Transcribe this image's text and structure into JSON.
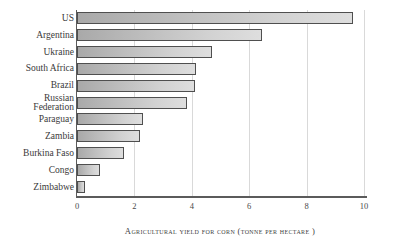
{
  "chart_data": {
    "type": "bar",
    "orientation": "horizontal",
    "title": "",
    "xlabel": "Agricultural yield for corn (tonne per hectare )",
    "ylabel": "",
    "categories": [
      "US",
      "Argentina",
      "Ukraine",
      "South Africa",
      "Brazil",
      "Russian\nFederation",
      "Paraguay",
      "Zambia",
      "Burkina Faso",
      "Congo",
      "Zimbabwe"
    ],
    "values": [
      9.6,
      6.45,
      4.7,
      4.15,
      4.1,
      3.85,
      2.3,
      2.2,
      1.65,
      0.8,
      0.28
    ],
    "xlim": [
      0,
      10
    ],
    "xticks": [
      0,
      2,
      4,
      6,
      8,
      10
    ],
    "xtick_labels": [
      "0",
      "2",
      "4",
      "6",
      "8",
      "10"
    ],
    "grid": true,
    "grid_axis": "x",
    "legend": false,
    "bar_color_start": "#a9a9a9",
    "bar_color_end": "#dedede",
    "bar_edge_color": "#4f4f4f",
    "grid_color": "#d9d9d9",
    "axis_color": "#5b5b5b",
    "text_color": "#3a3a3a",
    "background": "#ffffff"
  }
}
